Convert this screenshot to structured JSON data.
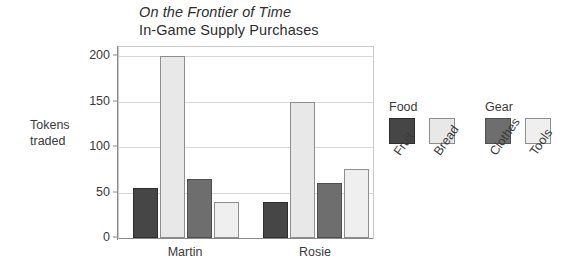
{
  "chart_data": {
    "type": "bar",
    "title": "On the Frontier of Time",
    "subtitle": "In-Game Supply Purchases",
    "xlabel": "",
    "ylabel": "Tokens traded",
    "ylabel_line1": "Tokens",
    "ylabel_line2": "traded",
    "categories": [
      "Martin",
      "Rosie"
    ],
    "series": [
      {
        "name": "Fruit",
        "group": "Food",
        "color": "#464646",
        "border": "#2d2d2d",
        "values": [
          55,
          40
        ]
      },
      {
        "name": "Bread",
        "group": "Food",
        "color": "#e8e8e8",
        "border": "#8e8e8e",
        "values": [
          200,
          150
        ]
      },
      {
        "name": "Clothes",
        "group": "Gear",
        "color": "#6e6e6e",
        "border": "#4f4f4f",
        "values": [
          65,
          60
        ]
      },
      {
        "name": "Tools",
        "group": "Gear",
        "color": "#efefef",
        "border": "#8e8e8e",
        "values": [
          40,
          76
        ]
      }
    ],
    "ylim": [
      0,
      210
    ],
    "yticks": [
      0,
      50,
      100,
      150,
      200
    ],
    "ytick_labels": [
      "0",
      "50",
      "100",
      "150",
      "200"
    ],
    "grid": true,
    "legend_position": "right"
  },
  "legend": {
    "groups": [
      {
        "title": "Food",
        "items": [
          {
            "label": "Fruit",
            "color": "#464646",
            "border": "#2d2d2d"
          },
          {
            "label": "Bread",
            "color": "#e8e8e8",
            "border": "#8e8e8e"
          }
        ]
      },
      {
        "title": "Gear",
        "items": [
          {
            "label": "Clothes",
            "color": "#6e6e6e",
            "border": "#4f4f4f"
          },
          {
            "label": "Tools",
            "color": "#efefef",
            "border": "#8e8e8e"
          }
        ]
      }
    ]
  }
}
